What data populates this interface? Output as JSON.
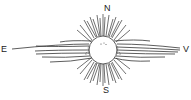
{
  "diagram": {
    "labels": {
      "north": "N",
      "south": "S",
      "east": "E",
      "west": "V"
    },
    "colors": {
      "stroke": "#333333",
      "background": "#ffffff"
    }
  }
}
